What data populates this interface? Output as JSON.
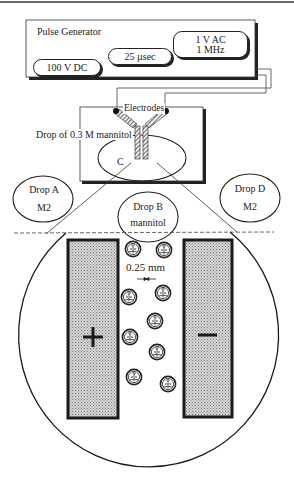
{
  "pulse_generator": {
    "title": "Pulse Generator",
    "buttons": [
      {
        "label": "100 V DC"
      },
      {
        "label": "25 µsec"
      },
      {
        "label_line1": "1 V AC",
        "label_line2": "1 MHz"
      }
    ]
  },
  "chamber": {
    "electrodes_label": "Electrodes",
    "drop_label": "Drop of 0.3 M mannitol",
    "center_label": "C"
  },
  "drops": [
    {
      "name": "Drop A",
      "medium": "M2"
    },
    {
      "name": "Drop B",
      "medium": "mannitol"
    },
    {
      "name": "Drop D",
      "medium": "M2"
    }
  ],
  "magnified_view": {
    "gap_label": "0.25 mm",
    "positive_symbol": "+",
    "negative_symbol": "—",
    "cell_count": 10
  },
  "colors": {
    "line": "#1a1a1a",
    "electrode_fill": "#bdbdbd",
    "background": "#ffffff"
  }
}
